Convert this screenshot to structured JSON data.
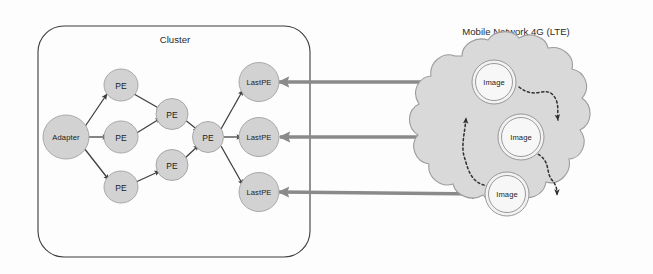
{
  "figure": {
    "kind": "architecture-diagram",
    "background_color": "#fdfdfd"
  },
  "cluster": {
    "title": "Cluster",
    "border_color": "#3b3b3b",
    "nodes": {
      "adapter": {
        "label": "Adapter"
      },
      "stage1": [
        {
          "label": "PE"
        },
        {
          "label": "PE"
        },
        {
          "label": "PE"
        }
      ],
      "stage2": [
        {
          "label": "PE"
        },
        {
          "label": "PE"
        }
      ],
      "merge": {
        "label": "PE"
      },
      "outputs": [
        {
          "label": "LastPE"
        },
        {
          "label": "LastPE"
        },
        {
          "label": "LastPE"
        }
      ]
    },
    "node_fill": "#d2d2d2",
    "node_stroke": "#a2a2a2"
  },
  "network": {
    "title": "Mobile Network 4G (LTE)",
    "cloud_fill": "#d9d9d9",
    "cloud_stroke": "#9c9c9c",
    "images": [
      {
        "label": "Image"
      },
      {
        "label": "Image"
      },
      {
        "label": "Image"
      }
    ]
  },
  "links": {
    "internal_arrow_color": "#3d3d3d",
    "bidirectional_arrow_color": "#8a8a8a",
    "dashed_arrow_color": "#2f2f2f",
    "bidirectional_count": 3,
    "dashed_count": 3
  }
}
